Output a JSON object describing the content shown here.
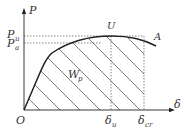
{
  "labels": {
    "y_axis": "P",
    "x_axis": "δ",
    "origin": "O",
    "pu_main": "P",
    "pu_sub": "u",
    "pa_main": "P",
    "pa_sub": "a",
    "peak": "U",
    "end": "A",
    "area_main": "W",
    "area_sub": "p",
    "du_main": "δ",
    "du_sub": "u",
    "dcr_main": "δ",
    "dcr_sub": "cr"
  },
  "colors": {
    "line": "#222222",
    "dotted": "#555555",
    "hatch": "#444444",
    "text": "#333333"
  }
}
